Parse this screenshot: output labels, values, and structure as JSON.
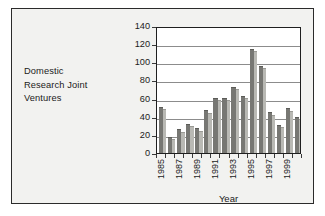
{
  "figure": {
    "side_label": "Domestic Research Joint Ventures",
    "side_label_lines": [
      "Domestic",
      "Research Joint",
      "Ventures"
    ],
    "border_color": "#2b2b2b",
    "background_color": "#f2f2f0"
  },
  "chart_data": {
    "type": "bar",
    "title": "",
    "xlabel": "Year",
    "ylabel": "",
    "categories": [
      "1985",
      "1986",
      "1987",
      "1988",
      "1989",
      "1990",
      "1991",
      "1992",
      "1993",
      "1994",
      "1995",
      "1996",
      "1997",
      "1998",
      "1999",
      "2000"
    ],
    "values": [
      50,
      17,
      25,
      31,
      26,
      46,
      60,
      60,
      72,
      62,
      114,
      95,
      44,
      30,
      48,
      39
    ],
    "tick_labels": [
      "1985",
      "1987",
      "1989",
      "1991",
      "1993",
      "1995",
      "1997",
      "1999"
    ],
    "tick_label_indices": [
      0,
      2,
      4,
      6,
      8,
      10,
      12,
      14
    ],
    "yticks": [
      0,
      20,
      40,
      60,
      80,
      100,
      120,
      140
    ],
    "ylim": [
      0,
      140
    ],
    "grid": true,
    "grid_axis": "y",
    "legend": false,
    "bar_color": "#777773",
    "bar_side_color": "#b9b9b4",
    "grid_color": "#8c8c8c",
    "axis_color": "#1f1f1f"
  }
}
